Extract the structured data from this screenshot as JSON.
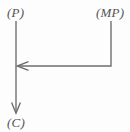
{
  "diagram": {
    "type": "flow-diagram",
    "background_color": "#fdfdfd",
    "stroke_color": "#6f6f6f",
    "stroke_width": 1.4,
    "nodes": [
      {
        "id": "premise",
        "label": "(P)",
        "x": 7,
        "y": 6
      },
      {
        "id": "modus-ponens",
        "label": "(MP)",
        "x": 96,
        "y": 6
      },
      {
        "id": "conclusion",
        "label": "(C)",
        "x": 7,
        "y": 116
      }
    ],
    "edges": [
      {
        "id": "premise-to-conclusion",
        "from": "premise",
        "to": "conclusion",
        "shape": "vertical-line",
        "arrowhead": "down",
        "path": "M 16 21 L 16 112"
      },
      {
        "id": "modus-ponens-to-premise-line",
        "from": "modus-ponens",
        "to": "premise-to-conclusion",
        "shape": "elbow-down-then-left",
        "arrowhead": "left",
        "path": "M 111 21 L 111 66 L 18 66"
      }
    ],
    "arrowheads": [
      {
        "id": "arrowhead-down",
        "direction": "down",
        "tip_x": 16,
        "tip_y": 113,
        "style": "open-barbed"
      },
      {
        "id": "arrowhead-left",
        "direction": "left",
        "tip_x": 16,
        "tip_y": 66,
        "style": "open-barbed"
      }
    ]
  }
}
